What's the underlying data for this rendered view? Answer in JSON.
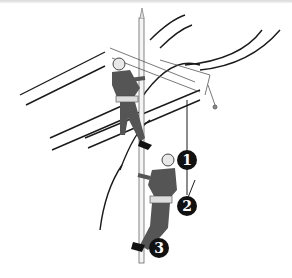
{
  "illustration": {
    "subject": "Two line workers climbing a utility pole with safety harnesses",
    "callouts": [
      {
        "label": "1"
      },
      {
        "label": "2"
      },
      {
        "label": "3"
      }
    ],
    "colors": {
      "line": "#1a1a1a",
      "worker_clothing": "#555555",
      "helmet": "#e8e8e8",
      "callout_bg": "#111111",
      "callout_text": "#ffffff"
    }
  }
}
